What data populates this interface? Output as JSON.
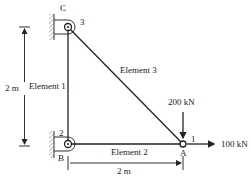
{
  "diagram": {
    "type": "plane truss",
    "nodes": [
      {
        "id": "C",
        "number": "3",
        "support": "pin (wall)"
      },
      {
        "id": "B",
        "number": "2",
        "support": "pin (wall)"
      },
      {
        "id": "A",
        "number": "1",
        "support": "free"
      }
    ],
    "elements": [
      {
        "label": "Element 1",
        "from": "B",
        "to": "C"
      },
      {
        "label": "Element 2",
        "from": "B",
        "to": "A"
      },
      {
        "label": "Element 3",
        "from": "C",
        "to": "A"
      }
    ],
    "loads": [
      {
        "label": "200 kN",
        "node": "A",
        "direction": "down"
      },
      {
        "label": "100 kN",
        "node": "A",
        "direction": "right"
      }
    ],
    "dimensions": [
      {
        "label": "2 m",
        "orientation": "vertical"
      },
      {
        "label": "2 m",
        "orientation": "horizontal"
      }
    ]
  }
}
